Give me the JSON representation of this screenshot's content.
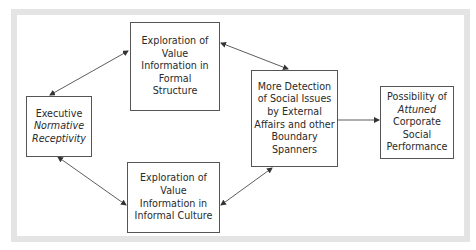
{
  "diagram": {
    "nodes": {
      "executive": {
        "lines": [
          "Executive",
          "Normative",
          "Receptivity"
        ],
        "italic_lines": [
          1,
          2
        ]
      },
      "formal": {
        "lines": [
          "Exploration of",
          "Value",
          "Information in",
          "Formal",
          "Structure"
        ]
      },
      "informal": {
        "lines": [
          "Exploration of",
          "Value",
          "Information in",
          "Informal Culture"
        ]
      },
      "detection": {
        "lines": [
          "More Detection",
          "of Social Issues",
          "by External",
          "Affairs and other",
          "Boundary",
          "Spanners"
        ]
      },
      "outcome": {
        "lines": [
          "Possibility of",
          "Attuned",
          "Corporate",
          "Social",
          "Performance"
        ],
        "italic_lines": [
          1
        ]
      }
    },
    "edges": [
      {
        "from": "executive",
        "to": "formal",
        "type": "bidirectional"
      },
      {
        "from": "executive",
        "to": "informal",
        "type": "bidirectional"
      },
      {
        "from": "formal",
        "to": "detection",
        "type": "bidirectional"
      },
      {
        "from": "informal",
        "to": "detection",
        "type": "bidirectional"
      },
      {
        "from": "detection",
        "to": "outcome",
        "type": "directed"
      }
    ],
    "colors": {
      "frame": "#e4e4e4",
      "box_border": "#555555",
      "arrow": "#333333",
      "text": "#2a2a2a"
    }
  }
}
